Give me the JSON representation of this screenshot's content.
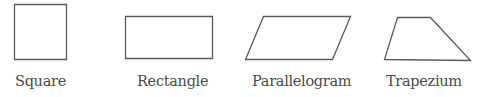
{
  "diagram": {
    "stroke_color": "#5a5a5a",
    "label_color": "#4a4a4a",
    "shapes": [
      {
        "name": "square",
        "label": "Square",
        "points": "14.5,4.5 66.5,4.5 66.5,59.5 14.5,59.5"
      },
      {
        "name": "rectangle",
        "label": "Rectangle",
        "points": "125.5,16.5 212.5,16.5 212.5,58.5 125.5,58.5"
      },
      {
        "name": "parallelogram",
        "label": "Parallelogram",
        "points": "263.5,16.5 350.5,16.5 332.5,59.5 245.5,59.5"
      },
      {
        "name": "trapezium",
        "label": "Trapezium",
        "points": "397.5,17.5 430.5,17.5 470.5,60.5 384.5,59.5"
      }
    ]
  }
}
